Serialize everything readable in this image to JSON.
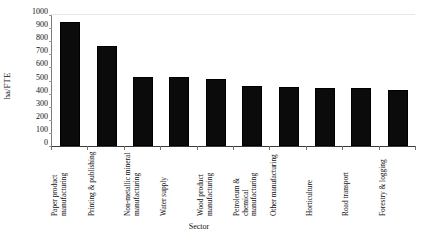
{
  "chart_data": {
    "type": "bar",
    "title": "",
    "xlabel": "Sector",
    "ylabel": "ha/FTE",
    "ylim": [
      0,
      1000
    ],
    "ytick_step": 100,
    "yticks": [
      "1000",
      "900",
      "800",
      "700",
      "600",
      "500",
      "400",
      "300",
      "200",
      "100",
      "0"
    ],
    "grid": false,
    "legend": null,
    "bar_color": "#0b0b0b",
    "categories": [
      "Paper product manufacturing",
      "Printing & publishing",
      "Non-metallic mineral manufacturing",
      "Water supply",
      "Wood product manufacturing",
      "Petroleum & chemical manufacturing",
      "Other manufacturing",
      "Horticulture",
      "Road transport",
      "Forestry & logging"
    ],
    "values": [
      945,
      760,
      530,
      530,
      515,
      455,
      450,
      445,
      445,
      425
    ]
  }
}
